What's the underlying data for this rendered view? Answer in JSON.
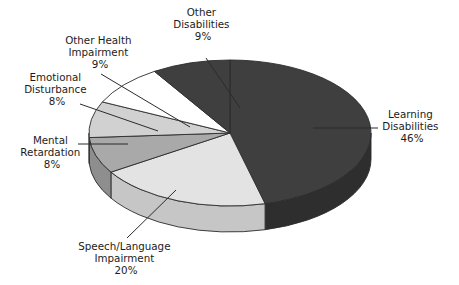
{
  "chart_data": {
    "type": "pie",
    "title": "",
    "subtitle": "",
    "xlabel": "",
    "ylabel": "",
    "legend_position": "none",
    "grid": false,
    "three_d": true,
    "value_suffix": "%",
    "categories": [
      "Learning Disabilities",
      "Speech/Language Impairment",
      "Other Disabilities",
      "Other Health Impairment",
      "Emotional Disturbance",
      "Mental Retardation"
    ],
    "values": [
      46,
      20,
      9,
      9,
      8,
      8
    ],
    "slices": [
      {
        "id": "learning-disabilities",
        "name_line1": "Learning",
        "name_line2": "Disabilities",
        "label": "Learning Disabilities",
        "value": 46,
        "value_text": "46%",
        "color": "#3f3f3f",
        "side_color": "#2e2e2e"
      },
      {
        "id": "speech-language-impairment",
        "name_line1": "Speech/Language",
        "name_line2": "Impairment",
        "label": "Speech/Language Impairment",
        "value": 20,
        "value_text": "20%",
        "color": "#e3e3e3",
        "side_color": "#c6c6c6"
      },
      {
        "id": "mental-retardation",
        "name_line1": "Mental",
        "name_line2": "Retardation",
        "label": "Mental Retardation",
        "value": 8,
        "value_text": "8%",
        "color": "#a9a9a9",
        "side_color": "#8e8e8e"
      },
      {
        "id": "emotional-disturbance",
        "name_line1": "Emotional",
        "name_line2": "Disturbance",
        "label": "Emotional Disturbance",
        "value": 8,
        "value_text": "8%",
        "color": "#d1d1d1",
        "side_color": "#b2b2b2"
      },
      {
        "id": "other-health-impairment",
        "name_line1": "Other Health",
        "name_line2": "Impairment",
        "label": "Other Health Impairment",
        "value": 9,
        "value_text": "9%",
        "color": "#ffffff",
        "side_color": "#dcdcdc"
      },
      {
        "id": "other-disabilities",
        "name_line1": "Other",
        "name_line2": "Disabilities",
        "label": "Other Disabilities",
        "value": 9,
        "value_text": "9%",
        "color": "#3f3f3f",
        "side_color": "#2e2e2e"
      }
    ]
  },
  "labels": {
    "other_disabilities": {
      "l1": "Other",
      "l2": "Disabilities",
      "l3": "9%"
    },
    "other_health_impairment": {
      "l1": "Other Health",
      "l2": "Impairment",
      "l3": "9%"
    },
    "emotional_disturbance": {
      "l1": "Emotional",
      "l2": "Disturbance",
      "l3": "8%"
    },
    "mental_retardation": {
      "l1": "Mental",
      "l2": "Retardation",
      "l3": "8%"
    },
    "speech_language_impairment": {
      "l1": "Speech/Language",
      "l2": "Impairment",
      "l3": "20%"
    },
    "learning_disabilities": {
      "l1": "Learning",
      "l2": "Disabilities",
      "l3": "46%"
    }
  }
}
